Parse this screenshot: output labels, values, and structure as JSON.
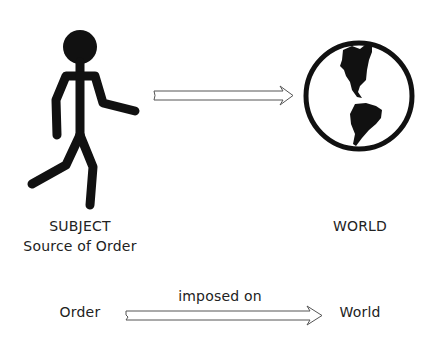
{
  "figure": {
    "subject": {
      "title": "SUBJECT",
      "subtitle": "Source of Order",
      "icon": "stick-figure-walking-icon"
    },
    "world": {
      "title": "WORLD",
      "icon": "globe-americas-icon"
    },
    "top_arrow": {
      "icon": "double-line-arrow-right-icon"
    },
    "relation": {
      "from": "Order",
      "label": "imposed on",
      "to": "World",
      "icon": "double-line-arrow-right-icon"
    },
    "colors": {
      "ink": "#111111",
      "text": "#222222",
      "arrow": "#555555",
      "background": "#ffffff"
    }
  }
}
